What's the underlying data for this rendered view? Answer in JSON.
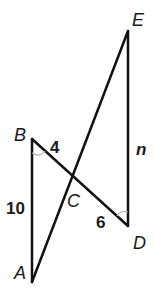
{
  "diagram": {
    "type": "geometry-figure",
    "vertices": {
      "A": {
        "label": "A"
      },
      "B": {
        "label": "B"
      },
      "C": {
        "label": "C"
      },
      "D": {
        "label": "D"
      },
      "E": {
        "label": "E"
      }
    },
    "side_labels": {
      "AB": "10",
      "BC": "4",
      "CD": "6",
      "DE": "n"
    },
    "angle_marks": [
      "B",
      "D"
    ],
    "colors": {
      "line": "#111111",
      "angle_arc": "#b0b0b0",
      "text": "#1a1a1a"
    }
  }
}
